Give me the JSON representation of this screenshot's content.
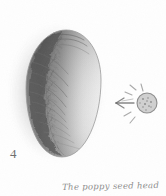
{
  "artwork": {
    "title": "Pencil tonal study of an egg-shaped form",
    "medium": "graphite pencil sketch",
    "background_color": "#fefefe",
    "graphite_color": "#5a5a5a",
    "light_graphite_color": "#a8a8a8"
  },
  "figure": {
    "number_label": "4",
    "subject_name": "poppy-seed-head",
    "outline_color": "#8a8a8a",
    "shadow_color": "#6b6b6b",
    "highlight_side": "right",
    "shadow_side": "left"
  },
  "light_source": {
    "symbol_name": "sun-circle",
    "arrow_name": "light-direction-arrow",
    "direction": "right-to-left",
    "circle_color": "#8c8c8c",
    "ray_count": 5
  },
  "caption": {
    "text": "The poppy seed head",
    "style": "handwritten italic",
    "color": "#8d8d8d"
  }
}
